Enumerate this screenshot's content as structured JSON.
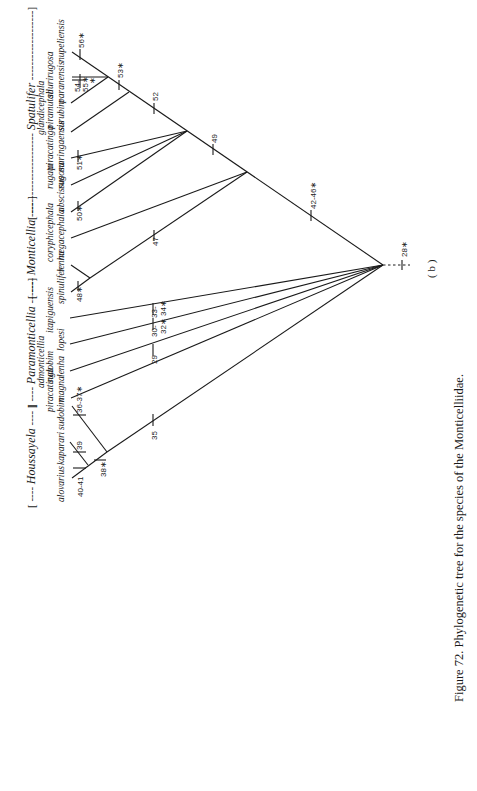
{
  "figure": {
    "caption": "Figure 72. Phylogenetic tree for the species of the Monticelliidae.",
    "panel_label": "( b )",
    "root_character": "28∗"
  },
  "genera": [
    {
      "name": "Houssayela",
      "bracket_open": "[ ----",
      "bracket_close": "---- ]"
    },
    {
      "name": "Paramonticellia",
      "bracket_open": "[ ----",
      "bracket_close": "------]"
    },
    {
      "name": "Monticellia",
      "bracket_open": "[ ----",
      "bracket_close": "---- ]"
    },
    {
      "name": "Spatulifer",
      "bracket_open": "[ ----------------------",
      "bracket_close": "-------------------]"
    }
  ],
  "taxa": {
    "alovarius": "alovarius",
    "kaparari": "kaparari",
    "sudobim": "sudobim",
    "piracatinga_magna_1": "piracatinga",
    "piracatinga_magna_2": "magna",
    "admonticellia_lenha_1": "admonticellia",
    "admonticellia_lenha_2": "sudobim",
    "admonticellia_lenha_3": "lenha",
    "lopesi": "lopesi",
    "itapiguensis": "itapiguensis",
    "spinulifer": "spinulifer",
    "lenha": "lenha",
    "coryphicephala_1": "coryphicephala",
    "coryphicephala_2": "megacephala",
    "abscissus": "abscissus",
    "rugata_1": "rugata",
    "rugata_2": "rugosa",
    "piracatinga_1": "piracatinga",
    "piracatinga_2": "maringaensis",
    "glandicephala_1": "glandicephala",
    "glandicephala_2": "piramutab",
    "glandicephala_3": "surubim",
    "siluri_1": "siluri",
    "siluri_2": "paranensis",
    "rugosa": "rugosa",
    "nupeliensis": "nupeliensis"
  },
  "characters": {
    "c40_41": "40-41",
    "c39": "39",
    "c38": "38∗",
    "c36_37": "36-37∗",
    "c35": "35",
    "c29": "29",
    "c30_32_a": "30-",
    "c30_32_b": "32∗",
    "c33_34_a": "33-",
    "c33_34_b": "34∗",
    "c48": "48∗",
    "c47": "47",
    "c42_46": "42-46∗",
    "c50": "50∗",
    "c51": "51∗",
    "c49": "49",
    "c52": "52",
    "c53": "53∗",
    "c54_55_a": "54-",
    "c54_55_b": "55∗",
    "c54_55_c": "∗",
    "c56": "56∗"
  }
}
